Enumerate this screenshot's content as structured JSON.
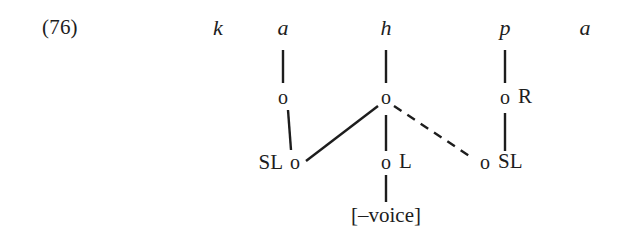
{
  "diagram": {
    "example_number": "(76)",
    "type": "autosegmental-feature-geometry-tree",
    "segment_tier": [
      {
        "id": "seg-k",
        "text": "k",
        "x": 218,
        "linked": false
      },
      {
        "id": "seg-a1",
        "text": "a",
        "x": 283,
        "linked": true
      },
      {
        "id": "seg-h",
        "text": "h",
        "x": 386,
        "linked": true
      },
      {
        "id": "seg-p",
        "text": "p",
        "x": 505,
        "linked": true
      },
      {
        "id": "seg-a2",
        "text": "a",
        "x": 585,
        "linked": false
      }
    ],
    "root_tier": [
      {
        "id": "root-a",
        "text": "o",
        "x": 283
      },
      {
        "id": "root-h",
        "text": "o",
        "x": 386
      },
      {
        "id": "root-p",
        "text": "o",
        "x": 505,
        "tag": "R"
      }
    ],
    "terminal_tier": [
      {
        "id": "term-sl-left",
        "text": "o",
        "x": 295,
        "tag": "SL",
        "tag_side": "left"
      },
      {
        "id": "term-l-center",
        "text": "o",
        "x": 386,
        "tag": "L",
        "tag_side": "right"
      },
      {
        "id": "term-sl-right",
        "text": "o",
        "x": 485,
        "tag": "SL",
        "tag_side": "right"
      }
    ],
    "feature_label": "[–voice]",
    "tags": {
      "sl_left": "SL",
      "l_center": "L",
      "sl_right": "SL",
      "r_right": "R"
    },
    "line_color": "#1d1d1d"
  }
}
